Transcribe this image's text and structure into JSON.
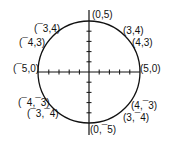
{
  "diagram": {
    "type": "circle-on-coordinate-axes",
    "center": [
      0,
      0
    ],
    "radius": 5,
    "tick_interval": 1,
    "points": [
      {
        "label": "(0,5)",
        "x": 0,
        "y": 5
      },
      {
        "label": "(3,4)",
        "x": 3,
        "y": 4
      },
      {
        "label": "(4,3)",
        "x": 4,
        "y": 3
      },
      {
        "label": "(5,0)",
        "x": 5,
        "y": 0
      },
      {
        "label": "(4,¯3)",
        "x": 4,
        "y": -3
      },
      {
        "label": "(3,¯4)",
        "x": 3,
        "y": -4
      },
      {
        "label": "(0,¯5)",
        "x": 0,
        "y": -5
      },
      {
        "label": "(¯3,¯4)",
        "x": -3,
        "y": -4
      },
      {
        "label": "(¯4,¯3)",
        "x": -4,
        "y": -3
      },
      {
        "label": "(¯5,0)",
        "x": -5,
        "y": 0
      },
      {
        "label": "(¯4,3)",
        "x": -4,
        "y": 3
      },
      {
        "label": "(¯3,4)",
        "x": -3,
        "y": 4
      }
    ]
  }
}
